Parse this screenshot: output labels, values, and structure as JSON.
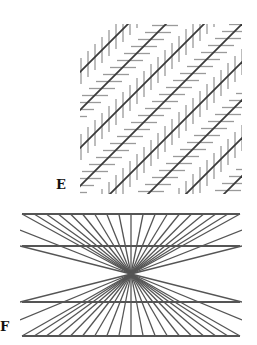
{
  "figure": {
    "panels": [
      {
        "id": "E",
        "label": "E",
        "illusion": "Zöllner illusion",
        "description": "Parallel diagonal lines crossed by alternating short vertical and horizontal hatch segments",
        "main_line_color": "#3a3a3a",
        "hatch_color": "#9a9a9a"
      },
      {
        "id": "F",
        "label": "F",
        "illusion": "Hering illusion",
        "description": "Four horizontal lines over a fan of lines radiating from a central point",
        "line_color": "#555555"
      }
    ]
  }
}
